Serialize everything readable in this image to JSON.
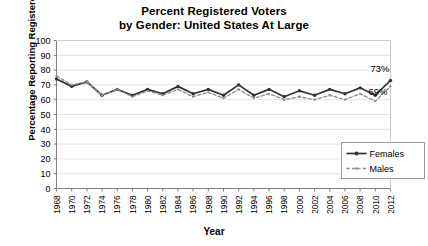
{
  "chart_data": {
    "type": "line",
    "title": "Percent Registered Voters\nby Gender: United States At Large",
    "title_line1": "Percent Registered Voters",
    "title_line2": "by Gender: United States At Large",
    "xlabel": "Year",
    "ylabel": "Percentage Reporting Registered",
    "ylim": [
      0,
      100
    ],
    "ytick_step": 10,
    "yticks": [
      "100",
      "90",
      "80",
      "70",
      "60",
      "50",
      "40",
      "30",
      "20",
      "10",
      "0"
    ],
    "grid": true,
    "legend_position": "bottom-right",
    "categories": [
      "1968",
      "1970",
      "1972",
      "1974",
      "1976",
      "1978",
      "1980",
      "1982",
      "1984",
      "1986",
      "1988",
      "1990",
      "1992",
      "1994",
      "1996",
      "1998",
      "2000",
      "2002",
      "2004",
      "2006",
      "2008",
      "2010",
      "2012"
    ],
    "series": [
      {
        "name": "Females",
        "color": "#333333",
        "style": "solid",
        "values": [
          74,
          69,
          72,
          63,
          67,
          63,
          67,
          64,
          69,
          64,
          67,
          63,
          70,
          63,
          67,
          62,
          66,
          63,
          67,
          64,
          68,
          63,
          73
        ]
      },
      {
        "name": "Males",
        "color": "#8c8c8c",
        "style": "dashed",
        "values": [
          76,
          70,
          72,
          63,
          67,
          62,
          66,
          63,
          67,
          62,
          65,
          61,
          67,
          61,
          64,
          60,
          62,
          60,
          63,
          60,
          64,
          59,
          69
        ]
      }
    ],
    "annotations": [
      {
        "label": "73%",
        "series": "Females",
        "year": "2012",
        "value": 73
      },
      {
        "label": "69%",
        "series": "Males",
        "year": "2012",
        "value": 69
      }
    ]
  },
  "legend": {
    "items": [
      {
        "label": "Females"
      },
      {
        "label": "Males"
      }
    ]
  }
}
